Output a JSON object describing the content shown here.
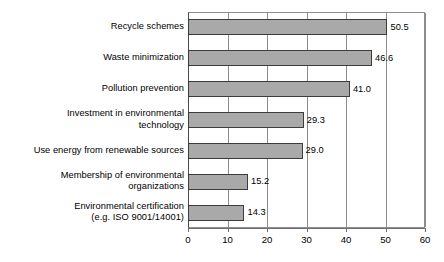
{
  "chart_data": {
    "type": "bar",
    "orientation": "horizontal",
    "title": "",
    "subtitle": "",
    "xlabel": "",
    "ylabel": "",
    "xlim": [
      0,
      60
    ],
    "xticks": [
      0,
      10,
      20,
      30,
      40,
      50,
      60
    ],
    "xtick_labels": [
      "0",
      "10",
      "20",
      "30",
      "40",
      "50",
      "60"
    ],
    "grid": "vertical",
    "legend": "none",
    "bar_color": "#a9a9a9",
    "bar_edge_color": "#3c3c3c",
    "categories": [
      "Recycle schemes",
      "Waste minimization",
      "Pollution prevention",
      "Investment in environmental\ntechnology",
      "Use energy from renewable sources",
      "Membership of environmental\norganizations",
      "Environmental certification\n(e.g. ISO 9001/14001)"
    ],
    "values": [
      50.5,
      46.6,
      41.0,
      29.3,
      29.0,
      15.2,
      14.3
    ],
    "value_labels": [
      "50.5",
      "46.6",
      "41.0",
      "29.3",
      "29.0",
      "15.2",
      "14.3"
    ]
  }
}
